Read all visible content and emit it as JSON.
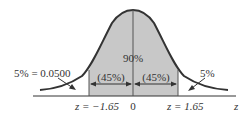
{
  "diagram": {
    "type": "normal-distribution",
    "colors": {
      "curve": "#333333",
      "shade": "#c8c8c8",
      "axis": "#333333",
      "text": "#333333",
      "background": "#ffffff"
    },
    "center_label": "90%",
    "left_half_label": "(45%)",
    "right_half_label": "(45%)",
    "left_tail_label": "5% = 0.0500",
    "right_tail_label": "5%",
    "axis_labels": {
      "left_z": "z = −1.65",
      "center": "0",
      "right_z": "z = 1.65",
      "axis_name": "z"
    }
  }
}
